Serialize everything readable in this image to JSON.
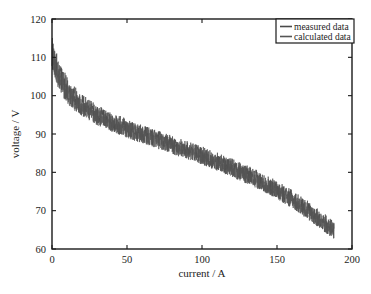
{
  "figure": {
    "background_color": "#ffffff",
    "axes_color": "#1a1a1a"
  },
  "chart_data": {
    "type": "line",
    "title": "",
    "xlabel": "current / A",
    "ylabel": "voltage / V",
    "xlim": [
      0,
      200
    ],
    "ylim": [
      60,
      120
    ],
    "xticks": [
      0,
      50,
      100,
      150,
      200
    ],
    "yticks": [
      60,
      70,
      80,
      90,
      100,
      110,
      120
    ],
    "xtick_labels": [
      "0",
      "50",
      "100",
      "150",
      "200"
    ],
    "ytick_labels": [
      "60",
      "70",
      "80",
      "90",
      "100",
      "110",
      "120"
    ],
    "grid": false,
    "tick_direction": "in",
    "legend_position": "upper right",
    "legend_entries": [
      "measured data",
      "calculated data"
    ],
    "series": [
      {
        "name": "measured data",
        "color": "#4a4a4a",
        "noise_amplitude": 2.4,
        "x": [
          0,
          2,
          5,
          8,
          12,
          16,
          20,
          25,
          30,
          35,
          40,
          45,
          50,
          55,
          60,
          65,
          70,
          75,
          80,
          85,
          90,
          95,
          100,
          105,
          110,
          115,
          120,
          125,
          130,
          135,
          140,
          145,
          150,
          155,
          160,
          165,
          170,
          175,
          180,
          185,
          188
        ],
        "y": [
          112.0,
          108.5,
          105.0,
          102.8,
          100.6,
          98.9,
          97.6,
          96.2,
          95.0,
          94.0,
          93.1,
          92.3,
          91.5,
          90.7,
          90.0,
          89.3,
          88.6,
          87.9,
          87.2,
          86.5,
          85.8,
          85.1,
          84.4,
          83.6,
          82.8,
          82.0,
          81.2,
          80.3,
          79.4,
          78.5,
          77.5,
          76.5,
          75.4,
          74.2,
          73.0,
          71.7,
          70.3,
          68.8,
          67.3,
          65.8,
          65.0
        ]
      },
      {
        "name": "calculated data",
        "color": "#555555",
        "noise_amplitude": 2.0,
        "x": [
          0,
          2,
          5,
          8,
          12,
          16,
          20,
          25,
          30,
          35,
          40,
          45,
          50,
          55,
          60,
          65,
          70,
          75,
          80,
          85,
          90,
          95,
          100,
          105,
          110,
          115,
          120,
          125,
          130,
          135,
          140,
          145,
          150,
          155,
          160,
          165,
          170,
          175,
          180,
          185,
          188
        ],
        "y": [
          110.5,
          107.5,
          104.2,
          102.0,
          99.9,
          98.3,
          97.0,
          95.7,
          94.5,
          93.5,
          92.6,
          91.8,
          91.0,
          90.3,
          89.6,
          88.9,
          88.2,
          87.5,
          86.8,
          86.1,
          85.4,
          84.7,
          84.0,
          83.2,
          82.4,
          81.6,
          80.8,
          79.9,
          79.0,
          78.1,
          77.1,
          76.1,
          75.0,
          73.8,
          72.6,
          71.3,
          69.9,
          68.4,
          66.9,
          65.4,
          64.6
        ]
      }
    ],
    "band_top_label": "upper envelope",
    "band_bottom_label": "lower envelope",
    "data_start_voltage": 112.0,
    "data_end_voltage": 65.0,
    "data_end_current": 188
  }
}
